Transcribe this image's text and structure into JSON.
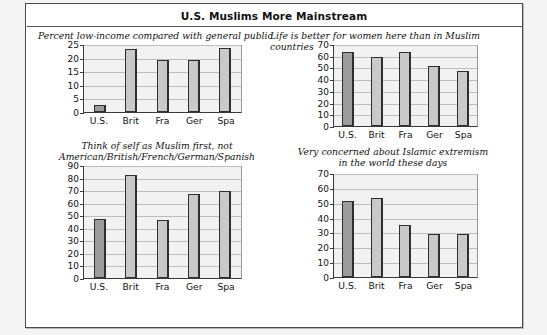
{
  "figure": {
    "title": "U.S. Muslims More Mainstream"
  },
  "chart_data": [
    {
      "id": "low-income",
      "type": "bar",
      "title": "Percent low-income compared with general public",
      "title_align": "left",
      "categories": [
        "U.S.",
        "Brit",
        "Fra",
        "Ger",
        "Spa"
      ],
      "values": [
        2.5,
        23,
        19,
        19,
        23.5
      ],
      "highlight_index": 0,
      "ylim": [
        0,
        25
      ],
      "yticks": [
        0,
        5,
        10,
        15,
        20,
        25
      ],
      "ytick_labels": [
        "0",
        "5",
        "10",
        "15",
        "20",
        "25"
      ],
      "xlabel": "",
      "ylabel": "",
      "grid": true,
      "legend": "none"
    },
    {
      "id": "life-better-women",
      "type": "bar",
      "title": "Life is better for women here than in Muslim countries",
      "title_align": "left",
      "categories": [
        "U.S.",
        "Brit",
        "Fra",
        "Ger",
        "Spa"
      ],
      "values": [
        63,
        59,
        63,
        51,
        47
      ],
      "highlight_index": 0,
      "ylim": [
        0,
        70
      ],
      "yticks": [
        0,
        10,
        20,
        30,
        40,
        50,
        60,
        70
      ],
      "ytick_labels": [
        "0",
        "10",
        "20",
        "30",
        "40",
        "50",
        "60",
        "70"
      ],
      "xlabel": "",
      "ylabel": "",
      "grid": true,
      "legend": "none"
    },
    {
      "id": "muslim-first",
      "type": "bar",
      "title": "Think of self as Muslim first, not\nAmerican/British/French/German/Spanish",
      "title_align": "center",
      "categories": [
        "U.S.",
        "Brit",
        "Fra",
        "Ger",
        "Spa"
      ],
      "values": [
        47,
        82,
        46,
        67,
        69
      ],
      "highlight_index": 0,
      "ylim": [
        0,
        90
      ],
      "yticks": [
        0,
        10,
        20,
        30,
        40,
        50,
        60,
        70,
        80,
        90
      ],
      "ytick_labels": [
        "0",
        "10",
        "20",
        "30",
        "40",
        "50",
        "60",
        "70",
        "80",
        "90"
      ],
      "xlabel": "",
      "ylabel": "",
      "grid": true,
      "legend": "none"
    },
    {
      "id": "islamic-extremism",
      "type": "bar",
      "title": "Very concerned about Islamic extremism\nin the world these days",
      "title_align": "center",
      "categories": [
        "U.S.",
        "Brit",
        "Fra",
        "Ger",
        "Spa"
      ],
      "values": [
        51,
        53,
        35,
        29,
        29
      ],
      "highlight_index": 0,
      "ylim": [
        0,
        70
      ],
      "yticks": [
        0,
        10,
        20,
        30,
        40,
        50,
        60,
        70
      ],
      "ytick_labels": [
        "0",
        "10",
        "20",
        "30",
        "40",
        "50",
        "60",
        "70"
      ],
      "xlabel": "",
      "ylabel": "",
      "grid": true,
      "legend": "none"
    }
  ],
  "style": {
    "bar_fill": "#c9c9c9",
    "bar_fill_highlight": "#9c9c9c",
    "bar_stroke": "#2f2f2f",
    "plot_bg": "#f2f2f2",
    "grid_color": "#bdbdbd",
    "frame_color": "#4a4a4a"
  }
}
